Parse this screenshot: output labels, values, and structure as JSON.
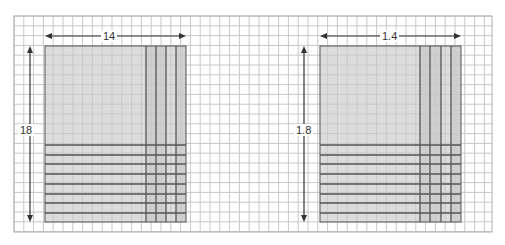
{
  "grid": {
    "x0": 14,
    "y0": 16,
    "x1": 492,
    "y1": 232,
    "cell": 9.8,
    "line_color": "#c8c8c8",
    "border_color": "#b0b0b0"
  },
  "colors": {
    "shade_light": "#dcdcdc",
    "shade_dark": "#cfcfcf",
    "strong_line": "#555555",
    "arrow": "#333333",
    "background": "#ffffff"
  },
  "panels": [
    {
      "name": "left-area-model",
      "width_label": "14",
      "height_label": "18",
      "rect": {
        "x": 45,
        "y": 46,
        "w": 141,
        "h": 176
      },
      "strong_vlines": [
        146,
        156,
        166,
        176
      ],
      "darker_cols": [
        [
          146,
          166
        ],
        [
          176,
          186
        ]
      ],
      "strong_hlines": [
        145,
        155,
        164,
        174,
        184,
        194,
        203,
        213
      ],
      "h_arrow": {
        "x1": 45,
        "x2": 186,
        "y": 36,
        "label_x": 108
      },
      "v_arrow": {
        "x": 30,
        "y1": 46,
        "y2": 222,
        "label_y": 130
      }
    },
    {
      "name": "right-area-model",
      "width_label": "1.4",
      "height_label": "1.8",
      "rect": {
        "x": 320,
        "y": 46,
        "w": 141,
        "h": 176
      },
      "strong_vlines": [
        420,
        430,
        441,
        451
      ],
      "darker_cols": [
        [
          420,
          441
        ],
        [
          451,
          461
        ]
      ],
      "strong_hlines": [
        145,
        155,
        164,
        174,
        184,
        194,
        203,
        213
      ],
      "h_arrow": {
        "x1": 320,
        "x2": 461,
        "y": 36,
        "label_x": 381
      },
      "v_arrow": {
        "x": 304,
        "y1": 46,
        "y2": 222,
        "label_y": 130
      }
    }
  ]
}
